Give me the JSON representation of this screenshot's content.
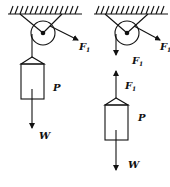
{
  "figures": [
    {
      "name": "fixed-pulley-with-block",
      "labels": {
        "tension": "F",
        "tension_sub": "1",
        "block": "P",
        "weight": "W"
      }
    },
    {
      "name": "free-body-separated",
      "labels": {
        "tension_right": "F",
        "tension_right_sub": "1",
        "rope_down": "F",
        "rope_down_sub": "1",
        "rope_up": "F",
        "rope_up_sub": "1",
        "block": "P",
        "weight": "W"
      }
    }
  ],
  "colors": {
    "line": "#111111",
    "background": "#ffffff"
  }
}
